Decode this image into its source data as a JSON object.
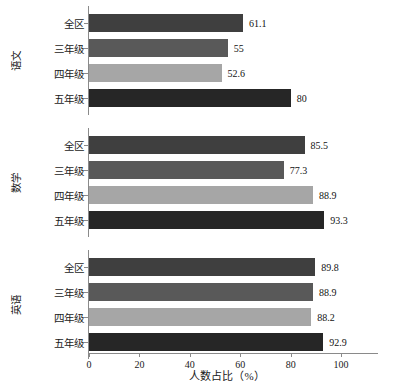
{
  "chart_data": {
    "type": "bar",
    "orientation": "horizontal",
    "title": "",
    "xlabel": "人数占比（%）",
    "ylabel": "",
    "xlim": [
      0,
      109.5
    ],
    "ylim": [
      0,
      12
    ],
    "grid": false,
    "legend": "none",
    "xticks": [
      0,
      20,
      40,
      60,
      80,
      100
    ],
    "xtick_labels": [
      "0",
      "20",
      "40",
      "60",
      "80",
      "100"
    ],
    "categories": [
      "全区",
      "三年级",
      "四年级",
      "五年级"
    ],
    "category_colors": [
      "#3f3f3f",
      "#595959",
      "#a6a6a6",
      "#262626"
    ],
    "groups": [
      {
        "name": "语文",
        "bars": [
          {
            "label": "全区",
            "value": 61.1,
            "value_text": "61.1",
            "color": "#3f3f3f"
          },
          {
            "label": "三年级",
            "value": 55,
            "value_text": "55",
            "color": "#595959"
          },
          {
            "label": "四年级",
            "value": 52.6,
            "value_text": "52.6",
            "color": "#a6a6a6"
          },
          {
            "label": "五年级",
            "value": 80,
            "value_text": "80",
            "color": "#262626"
          }
        ]
      },
      {
        "name": "数学",
        "bars": [
          {
            "label": "全区",
            "value": 85.5,
            "value_text": "85.5",
            "color": "#3f3f3f"
          },
          {
            "label": "三年级",
            "value": 77.3,
            "value_text": "77.3",
            "color": "#595959"
          },
          {
            "label": "四年级",
            "value": 88.9,
            "value_text": "88.9",
            "color": "#a6a6a6"
          },
          {
            "label": "五年级",
            "value": 93.3,
            "value_text": "93.3",
            "color": "#262626"
          }
        ]
      },
      {
        "name": "英语",
        "bars": [
          {
            "label": "全区",
            "value": 89.8,
            "value_text": "89.8",
            "color": "#3f3f3f"
          },
          {
            "label": "三年级",
            "value": 88.9,
            "value_text": "88.9",
            "color": "#595959"
          },
          {
            "label": "四年级",
            "value": 88.2,
            "value_text": "88.2",
            "color": "#a6a6a6"
          },
          {
            "label": "五年级",
            "value": 92.9,
            "value_text": "92.9",
            "color": "#262626"
          }
        ]
      }
    ]
  }
}
